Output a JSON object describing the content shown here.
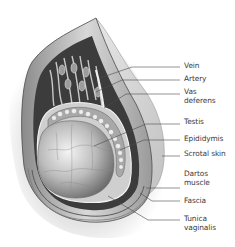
{
  "diagram": {
    "labels": [
      {
        "id": "vein",
        "text": "Vein",
        "x": 184,
        "y": 62
      },
      {
        "id": "artery",
        "text": "Artery",
        "x": 184,
        "y": 75
      },
      {
        "id": "vas-deferens",
        "text": "Vas\ndeferens",
        "x": 184,
        "y": 88
      },
      {
        "id": "testis",
        "text": "Testis",
        "x": 184,
        "y": 118
      },
      {
        "id": "epididymis",
        "text": "Epididymis",
        "x": 184,
        "y": 135
      },
      {
        "id": "scrotal-skin",
        "text": "Scrotal skin",
        "x": 184,
        "y": 150
      },
      {
        "id": "dartos-muscle",
        "text": "Dartos\nmuscle",
        "x": 184,
        "y": 170
      },
      {
        "id": "fascia",
        "text": "Fascia",
        "x": 184,
        "y": 197
      },
      {
        "id": "tunica-vaginalis",
        "text": "Tunica\nvaginalis",
        "x": 184,
        "y": 215
      }
    ],
    "leader_lines": [
      {
        "to": "vein",
        "points": "180,67 132,67 100,78"
      },
      {
        "to": "artery",
        "points": "180,80 122,80 96,92"
      },
      {
        "to": "vas-deferens",
        "points": "180,94 126,94 104,108"
      },
      {
        "to": "testis",
        "points": "180,124 146,124 94,146"
      },
      {
        "to": "epididymis",
        "points": "180,140 144,140 120,150"
      },
      {
        "to": "scrotal-skin",
        "points": "180,156 162,156"
      },
      {
        "to": "dartos-muscle",
        "points": "180,188 146,188"
      },
      {
        "to": "fascia",
        "points": "180,201 152,201 140,193"
      },
      {
        "to": "tunica-vaginalis",
        "points": "180,220 148,220 108,196"
      }
    ],
    "colors": {
      "line": "#4a4a4a",
      "text": "#3a3a3a",
      "shadow": "#d9d9d9",
      "tissue_dark": "#5a5a5a",
      "tissue_mid": "#9a9a9a",
      "tissue_light": "#e8e8e8"
    }
  }
}
